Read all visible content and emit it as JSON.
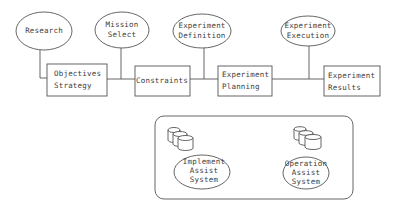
{
  "diagram": {
    "top_ellipses": [
      {
        "id": "research",
        "lines": [
          "Research"
        ]
      },
      {
        "id": "mission-select",
        "lines": [
          "Mission",
          "Select"
        ]
      },
      {
        "id": "experiment-definition",
        "lines": [
          "Experiment",
          "Definition"
        ]
      },
      {
        "id": "experiment-execution",
        "lines": [
          "Experiment",
          "Execution"
        ]
      }
    ],
    "process_boxes": [
      {
        "id": "objectives-strategy",
        "lines": [
          "Objectives",
          "Strategy"
        ]
      },
      {
        "id": "constraints",
        "lines": [
          "Constraints"
        ]
      },
      {
        "id": "experiment-planning",
        "lines": [
          "Experiment",
          "Planning"
        ]
      },
      {
        "id": "experiment-results",
        "lines": [
          "Experiment",
          "Results"
        ]
      }
    ],
    "assist_panel": {
      "systems": [
        {
          "id": "implement-assist-system",
          "lines": [
            "Implement",
            "Assist",
            "System"
          ],
          "icon": "database-stack-icon"
        },
        {
          "id": "operation-assist-system",
          "lines": [
            "Operation",
            "Assist",
            "System"
          ],
          "icon": "database-stack-icon"
        }
      ]
    },
    "colors": {
      "stroke": "#555555",
      "text": "#3c3c3c",
      "background": "#ffffff"
    }
  }
}
